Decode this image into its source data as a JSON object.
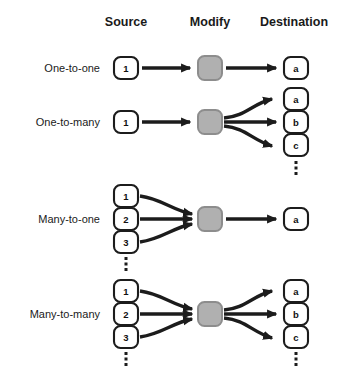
{
  "diagram": {
    "colors": {
      "stroke": "#1c1c1c",
      "node_fill": "#ffffff",
      "modify_fill": "#b0b0b0",
      "modify_stroke": "#8d8d8d",
      "background": "#ffffff"
    },
    "columns": [
      {
        "key": "source",
        "label": "Source",
        "x": 126
      },
      {
        "key": "modify",
        "label": "Modify",
        "x": 210
      },
      {
        "key": "destination",
        "label": "Destination",
        "x": 294
      }
    ],
    "rows": [
      {
        "key": "one-to-one",
        "label": "One-to-one",
        "sources": [
          "1"
        ],
        "source_ellipsis": false,
        "modify": "",
        "destinations": [
          "a"
        ],
        "destination_ellipsis": false
      },
      {
        "key": "one-to-many",
        "label": "One-to-many",
        "sources": [
          "1"
        ],
        "source_ellipsis": false,
        "modify": "",
        "destinations": [
          "a",
          "b",
          "c"
        ],
        "destination_ellipsis": true
      },
      {
        "key": "many-to-one",
        "label": "Many-to-one",
        "sources": [
          "1",
          "2",
          "3"
        ],
        "source_ellipsis": true,
        "modify": "",
        "destinations": [
          "a"
        ],
        "destination_ellipsis": false
      },
      {
        "key": "many-to-many",
        "label": "Many-to-many",
        "sources": [
          "1",
          "2",
          "3"
        ],
        "source_ellipsis": true,
        "modify": "",
        "destinations": [
          "a",
          "b",
          "c"
        ],
        "destination_ellipsis": true
      }
    ],
    "ellipsis_glyph": "vertical-ellipsis"
  }
}
